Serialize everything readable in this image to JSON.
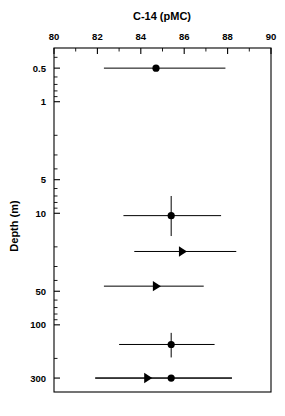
{
  "chart_data": {
    "type": "scatter",
    "title": "",
    "xlabel": "C-14 (pMC)",
    "ylabel": "Depth (m)",
    "xlim": [
      80,
      90
    ],
    "ylim": [
      0.33,
      400
    ],
    "x_axis_position": "top",
    "y_axis_scale": "log",
    "y_axis_direction": "inverted",
    "grid": false,
    "legend": null,
    "xticks": [
      80,
      82,
      84,
      86,
      88,
      90
    ],
    "xtick_labels": [
      "80",
      "82",
      "84",
      "86",
      "88",
      "90"
    ],
    "x_minor_ticks": [
      81,
      83,
      85,
      87,
      89
    ],
    "yticks": [
      0.5,
      1,
      5,
      10,
      50,
      100,
      300
    ],
    "ytick_labels": [
      "0.5",
      "1",
      "5",
      "10",
      "50",
      "100",
      "300"
    ],
    "points": [
      {
        "id": "sample-1",
        "depth": 0.5,
        "value": 84.7,
        "x_err_low": 82.3,
        "x_err_high": 87.9,
        "marker": "circle",
        "has_y_error": false
      },
      {
        "id": "sample-2",
        "depth": 10.5,
        "value": 85.4,
        "x_err_low": 83.2,
        "x_err_high": 87.7,
        "marker": "circle",
        "has_y_error": true,
        "y_err_low": 7.0,
        "y_err_high": 16.0
      },
      {
        "id": "sample-3",
        "depth": 22.0,
        "value": 85.9,
        "x_err_low": 83.7,
        "x_err_high": 88.4,
        "marker": "triangle-right",
        "has_y_error": false
      },
      {
        "id": "sample-4",
        "depth": 45.0,
        "value": 84.7,
        "x_err_low": 82.3,
        "x_err_high": 86.9,
        "marker": "triangle-right",
        "has_y_error": false
      },
      {
        "id": "sample-5",
        "depth": 150.0,
        "value": 85.4,
        "x_err_low": 83.0,
        "x_err_high": 87.4,
        "marker": "circle",
        "has_y_error": true,
        "y_err_low": 118.0,
        "y_err_high": 196.0
      },
      {
        "id": "sample-6",
        "depth": 300.0,
        "value": 84.3,
        "x_err_low": 81.9,
        "x_err_high": 88.2,
        "marker": "triangle-right",
        "has_y_error": false
      },
      {
        "id": "sample-7",
        "depth": 300.0,
        "value": 85.4,
        "x_err_low": 81.9,
        "x_err_high": 88.2,
        "marker": "circle",
        "has_y_error": false
      }
    ]
  },
  "colors": {
    "marker": "#000000",
    "axis": "#000000",
    "background": "#ffffff"
  }
}
